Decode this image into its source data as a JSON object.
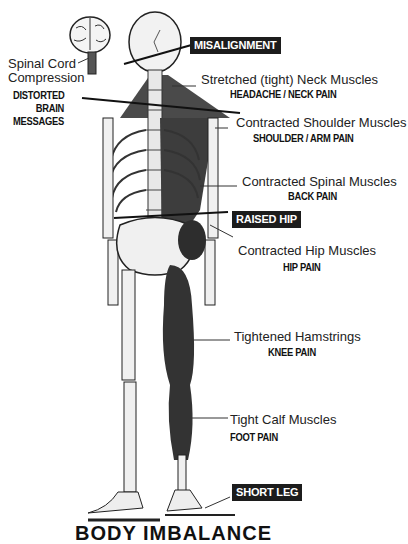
{
  "labels": {
    "spinal_cord": [
      "Spinal Cord",
      "Compression"
    ],
    "distorted": [
      "DISTORTED",
      "BRAIN",
      "MESSAGES"
    ],
    "neck": {
      "muscle": "Stretched (tight) Neck Muscles",
      "pain": "HEADACHE / NECK PAIN"
    },
    "shoulder": {
      "muscle": "Contracted Shoulder Muscles",
      "pain": "SHOULDER / ARM PAIN"
    },
    "spinal": {
      "muscle": "Contracted Spinal Muscles",
      "pain": "BACK PAIN"
    },
    "hip": {
      "muscle": "Contracted Hip Muscles",
      "pain": "HIP PAIN"
    },
    "hamstrings": {
      "muscle": "Tightened Hamstrings",
      "pain": "KNEE PAIN"
    },
    "calf": {
      "muscle": "Tight Calf Muscles",
      "pain": "FOOT PAIN"
    }
  },
  "tags": {
    "misalignment": "MISALIGNMENT",
    "raised_hip": "RAISED HIP",
    "short_leg": "SHORT LEG"
  },
  "title": "BODY IMBALANCE"
}
